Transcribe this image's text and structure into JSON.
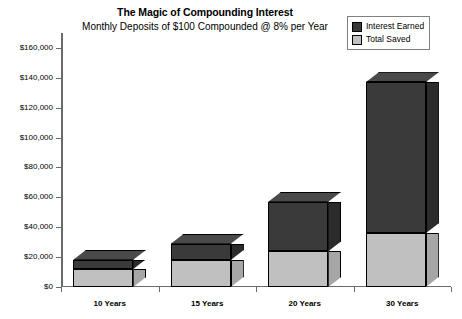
{
  "chart_data": {
    "type": "bar",
    "title": "The Magic of Compounding Interest",
    "subtitle": "Monthly Deposits of $100 Compounded @ 8% per Year",
    "xlabel": "",
    "ylabel": "",
    "grid": false,
    "legend_position": "top-right",
    "stacked": true,
    "categories": [
      "10 Years",
      "15 Years",
      "20 Years",
      "30 Years"
    ],
    "series": [
      {
        "name": "Total Saved",
        "values": [
          12000,
          18000,
          24000,
          36000
        ]
      },
      {
        "name": "Interest Earned",
        "values": [
          6300,
          11000,
          33000,
          101000
        ]
      }
    ],
    "totals": [
      18300,
      29000,
      57000,
      137000
    ],
    "ylim": [
      0,
      170000
    ],
    "ytick_values": [
      0,
      20000,
      40000,
      60000,
      80000,
      100000,
      120000,
      140000,
      160000
    ],
    "ytick_labels": [
      "$0",
      "$20,000",
      "$40,000",
      "$60,000",
      "$80,000",
      "$100,000",
      "$120,000",
      "$140,000",
      "$160,000"
    ]
  },
  "legend": {
    "items": [
      {
        "label": "Interest Earned",
        "color": "#3a3a3a"
      },
      {
        "label": "Total Saved",
        "color": "#c0c0c0"
      }
    ]
  },
  "colors": {
    "interest_earned": "#3a3a3a",
    "total_saved": "#c0c0c0",
    "axis": "#6b6b6b",
    "background": "#ffffff"
  }
}
